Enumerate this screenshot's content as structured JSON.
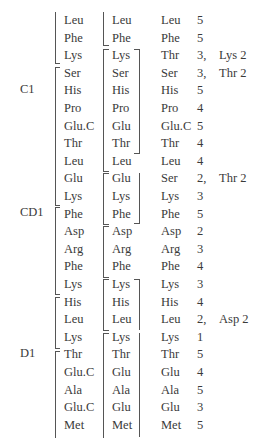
{
  "groups": [
    {
      "label": "C1",
      "row": 5
    },
    {
      "label": "CD1",
      "row": 12
    },
    {
      "label": "D1",
      "row": 20
    }
  ],
  "rows": [
    {
      "a": "Leu",
      "b": "Leu",
      "c": "Leu",
      "n": "5",
      "note": ""
    },
    {
      "a": "Phe",
      "b": "Phe",
      "c": "Phe",
      "n": "5",
      "note": ""
    },
    {
      "a": "Lys",
      "b": "Lys",
      "c": "Thr",
      "n": "3,",
      "note": "Lys 2"
    },
    {
      "a": "Ser",
      "b": "Ser",
      "c": "Ser",
      "n": "3,",
      "note": "Thr 2"
    },
    {
      "a": "His",
      "b": "His",
      "c": "His",
      "n": "5",
      "note": ""
    },
    {
      "a": "Pro",
      "b": "Pro",
      "c": "Pro",
      "n": "4",
      "note": ""
    },
    {
      "a": "Glu.C",
      "b": "Glu",
      "c": "Glu.C",
      "n": "5",
      "note": ""
    },
    {
      "a": "Thr",
      "b": "Thr",
      "c": "Thr",
      "n": "4",
      "note": ""
    },
    {
      "a": "Leu",
      "b": "Leu",
      "c": "Leu",
      "n": "4",
      "note": ""
    },
    {
      "a": "Glu",
      "b": "Glu",
      "c": "Ser",
      "n": "2,",
      "note": "Thr 2"
    },
    {
      "a": "Lys",
      "b": "Lys",
      "c": "Lys",
      "n": "3",
      "note": ""
    },
    {
      "a": "Phe",
      "b": "Phe",
      "c": "Phe",
      "n": "5",
      "note": ""
    },
    {
      "a": "Asp",
      "b": "Asp",
      "c": "Asp",
      "n": "2",
      "note": ""
    },
    {
      "a": "Arg",
      "b": "Arg",
      "c": "Arg",
      "n": "3",
      "note": ""
    },
    {
      "a": "Phe",
      "b": "Phe",
      "c": "Phe",
      "n": "4",
      "note": ""
    },
    {
      "a": "Lys",
      "b": "Lys",
      "c": "Lys",
      "n": "3",
      "note": ""
    },
    {
      "a": "His",
      "b": "His",
      "c": "His",
      "n": "4",
      "note": ""
    },
    {
      "a": "Leu",
      "b": "Leu",
      "c": "Leu",
      "n": "2,",
      "note": "Asp 2"
    },
    {
      "a": "Lys",
      "b": "Lys",
      "c": "Lys",
      "n": "1",
      "note": ""
    },
    {
      "a": "Thr",
      "b": "Thr",
      "c": "Thr",
      "n": "5",
      "note": ""
    },
    {
      "a": "Glu.C",
      "b": "Glu",
      "c": "Glu",
      "n": "4",
      "note": ""
    },
    {
      "a": "Ala",
      "b": "Ala",
      "c": "Ala",
      "n": "5",
      "note": ""
    },
    {
      "a": "Glu.C",
      "b": "Glu",
      "c": "Glu",
      "n": "3",
      "note": ""
    },
    {
      "a": "Met",
      "b": "Met",
      "c": "Met",
      "n": "5",
      "note": ""
    }
  ]
}
